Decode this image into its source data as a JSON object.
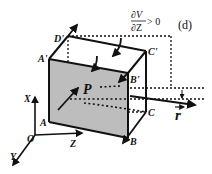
{
  "diagram": {
    "panel_label": "(d)",
    "condition": {
      "numerator": "∂V",
      "denominator": "∂Z",
      "relation": "> 0"
    },
    "vertices": {
      "A": "A",
      "B": "B",
      "C": "C",
      "D_prime": "D'",
      "A_prime": "A'",
      "B_prime": "B'",
      "C_prime": "C'"
    },
    "point": "P",
    "vector": "r",
    "axes": {
      "x": "X",
      "y": "Y",
      "z": "Z",
      "origin": "O"
    },
    "colors": {
      "face_fill": "#bdbdbd",
      "stroke": "#111111"
    }
  }
}
